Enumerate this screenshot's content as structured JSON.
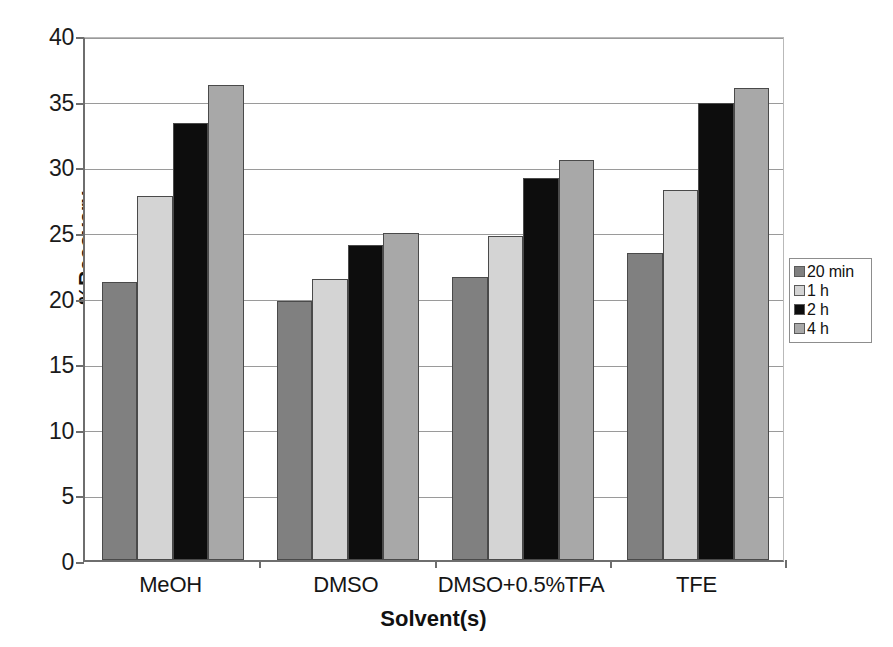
{
  "chart_data": {
    "type": "bar",
    "title": "",
    "xlabel": "Solvent(s)",
    "ylabel": "%Recovery",
    "categories": [
      "MeOH",
      "DMSO",
      "DMSO+0.5%TFA",
      "TFE"
    ],
    "series": [
      {
        "name": "20 min",
        "color": "#808080",
        "values": [
          21.2,
          19.7,
          21.6,
          23.4
        ]
      },
      {
        "name": "1 h",
        "color": "#d4d4d4",
        "values": [
          27.7,
          21.4,
          24.7,
          28.2
        ]
      },
      {
        "name": "2 h",
        "color": "#0d0d0d",
        "values": [
          33.3,
          24.0,
          29.1,
          34.8
        ]
      },
      {
        "name": "4 h",
        "color": "#a8a8a8",
        "values": [
          36.2,
          24.9,
          30.5,
          36.0
        ]
      }
    ],
    "ylim": [
      0,
      40
    ],
    "yticks": [
      0,
      5,
      10,
      15,
      20,
      25,
      30,
      35,
      40
    ],
    "ytick_labels": [
      "0",
      "5",
      "10",
      "15",
      "20",
      "25",
      "30",
      "35",
      "40"
    ],
    "grid": true,
    "grid_axis": "y",
    "legend_position": "right",
    "bar_border_color": "#4a4a4a",
    "grid_color": "#9a9a9a",
    "axis_color": "#6e6e6e",
    "background": "#ffffff"
  },
  "legend": {
    "items": [
      {
        "label": "20 min",
        "color": "#808080"
      },
      {
        "label": "1 h",
        "color": "#d4d4d4"
      },
      {
        "label": "2 h",
        "color": "#0d0d0d"
      },
      {
        "label": "4 h",
        "color": "#a8a8a8"
      }
    ]
  }
}
